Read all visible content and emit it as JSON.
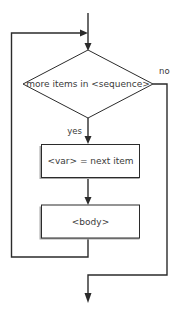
{
  "diagram": {
    "type": "flowchart",
    "background_color": "#ffffff",
    "line_color": "#2b2b2b",
    "text_color": "#3a3a3a",
    "shadow_color": "#a8a8a8",
    "nodes": [
      {
        "id": "decision",
        "shape": "diamond",
        "label": "more items in <sequence>"
      },
      {
        "id": "assign",
        "shape": "rectangle",
        "label": "<var> = next item"
      },
      {
        "id": "body",
        "shape": "rectangle",
        "label": "<body>"
      }
    ],
    "edge_labels": {
      "yes": "yes",
      "no": "no"
    }
  }
}
